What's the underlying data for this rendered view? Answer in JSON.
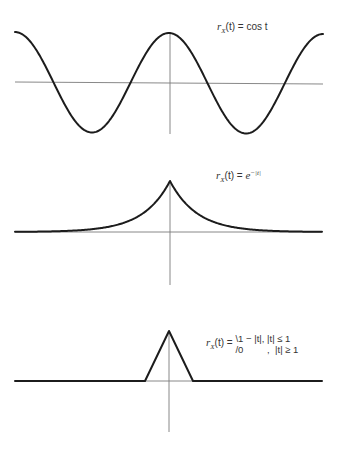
{
  "chart_data": [
    {
      "type": "line",
      "title": "r_X(t) = cos t",
      "label": {
        "lhs": "r",
        "sub": "X",
        "arg": "(t)",
        "eq": " = ",
        "rhs": "cos t"
      },
      "function": "cos(t)",
      "x": [
        -6.28,
        -4.71,
        -3.14,
        -1.57,
        0,
        1.57,
        3.14,
        4.71,
        6.28
      ],
      "values": [
        1,
        0,
        -1,
        0,
        1,
        0,
        -1,
        0,
        1
      ],
      "xlim": [
        -6.28,
        6.28
      ],
      "ylim": [
        -1,
        1
      ],
      "xlabel": "",
      "ylabel": "",
      "grid": false,
      "axes": "cross-at-origin"
    },
    {
      "type": "line",
      "title": "r_X(t) = e^{-|t|}",
      "label": {
        "lhs": "r",
        "sub": "X",
        "arg": "(t)",
        "eq": " = ",
        "base": "e",
        "exp": "−|t|"
      },
      "function": "exp(-|t|)",
      "x": [
        -5,
        -4,
        -3,
        -2,
        -1,
        0,
        1,
        2,
        3,
        4,
        5
      ],
      "values": [
        0.007,
        0.018,
        0.05,
        0.135,
        0.368,
        1,
        0.368,
        0.135,
        0.05,
        0.018,
        0.007
      ],
      "xlim": [
        -5.7,
        5.7
      ],
      "ylim": [
        0,
        1
      ],
      "xlabel": "",
      "ylabel": "",
      "grid": false,
      "axes": "cross-at-origin"
    },
    {
      "type": "line",
      "title": "r_X(t) = {1 − |t|, |t| ≤ 1; 0, |t| ≥ 1}",
      "label": {
        "lhs": "r",
        "sub": "X",
        "arg": "(t)",
        "eq": " = ",
        "case1": "1 − |t|,  |t| ≤ 1",
        "case2": "0         ,  |t| ≥ 1"
      },
      "function": "max(0, 1-|t|)",
      "x": [
        -6.3,
        -1,
        0,
        1,
        6.3
      ],
      "values": [
        0,
        0,
        1,
        0,
        0
      ],
      "xlim": [
        -6.3,
        6.3
      ],
      "ylim": [
        0,
        1
      ],
      "xlabel": "",
      "ylabel": "",
      "grid": false,
      "axes": "cross-at-origin"
    }
  ]
}
